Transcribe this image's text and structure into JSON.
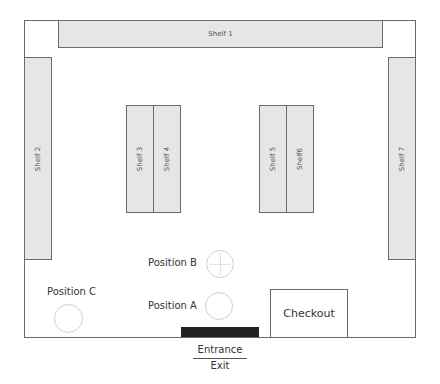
{
  "diagram": {
    "type": "store floor plan",
    "shelves": [
      {
        "id": "shelf-1",
        "label": "Shelf 1",
        "orientation": "horizontal"
      },
      {
        "id": "shelf-2",
        "label": "Shelf 2",
        "orientation": "vertical"
      },
      {
        "id": "shelf-3",
        "label": "Shelf 3",
        "orientation": "vertical"
      },
      {
        "id": "shelf-4",
        "label": "Shelf 4",
        "orientation": "vertical"
      },
      {
        "id": "shelf-5",
        "label": "Shelf 5",
        "orientation": "vertical"
      },
      {
        "id": "shelf-6",
        "label": "Shelf6",
        "orientation": "vertical"
      },
      {
        "id": "shelf-7",
        "label": "Shelf 7",
        "orientation": "vertical"
      }
    ],
    "positions": [
      {
        "id": "position-a",
        "label": "Position A"
      },
      {
        "id": "position-b",
        "label": "Position B"
      },
      {
        "id": "position-c",
        "label": "Position C"
      }
    ],
    "checkout": {
      "label": "Checkout"
    },
    "entrance": {
      "top_label": "Entrance",
      "bottom_label": "Exit"
    },
    "colors": {
      "shelf_fill": "#e6e6e6",
      "outline": "#6a6a6a",
      "door": "#222222"
    }
  }
}
